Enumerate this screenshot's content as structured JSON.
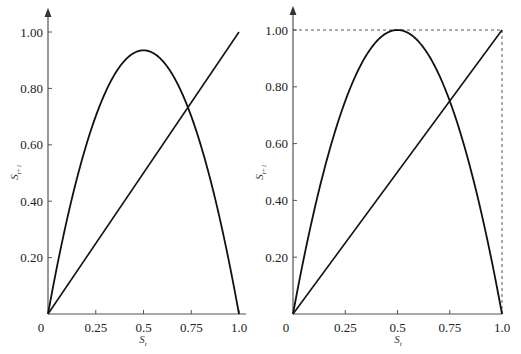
{
  "chart_data": [
    {
      "type": "line",
      "title": "",
      "xlabel": "S_t",
      "ylabel": "S_{t+1}",
      "xlim": [
        0,
        1.0
      ],
      "ylim": [
        0,
        1.0
      ],
      "x_ticks": [
        "0",
        "0.25",
        "0.5",
        "0.75",
        "1.0"
      ],
      "x_tick_values": [
        0,
        0.25,
        0.5,
        0.75,
        1.0
      ],
      "y_ticks": [
        "0.20",
        "0.40",
        "0.60",
        "0.80",
        "1.00"
      ],
      "y_tick_values": [
        0.2,
        0.4,
        0.6,
        0.8,
        1.0
      ],
      "grid": false,
      "series": [
        {
          "name": "logistic map",
          "kind": "parabola",
          "growth_rate": 3.74,
          "peak": {
            "x": 0.5,
            "y": 0.935
          },
          "x": [
            0,
            0.1,
            0.2,
            0.3,
            0.4,
            0.5,
            0.6,
            0.7,
            0.8,
            0.9,
            1.0
          ],
          "y": [
            0,
            0.337,
            0.598,
            0.785,
            0.898,
            0.935,
            0.898,
            0.785,
            0.598,
            0.337,
            0
          ]
        },
        {
          "name": "45-degree line",
          "kind": "identity",
          "x": [
            0,
            1.0
          ],
          "y": [
            0,
            1.0
          ]
        }
      ],
      "annotations": [
        {
          "text": "intersection",
          "x": 0.733,
          "y": 0.733
        }
      ],
      "bounding_box_dashed": false
    },
    {
      "type": "line",
      "title": "",
      "xlabel": "S_t",
      "ylabel": "S_{t+1}",
      "xlim": [
        0,
        1.0
      ],
      "ylim": [
        0,
        1.0
      ],
      "x_ticks": [
        "0",
        "0.25",
        "0.5",
        "0.75",
        "1.0"
      ],
      "x_tick_values": [
        0,
        0.25,
        0.5,
        0.75,
        1.0
      ],
      "y_ticks": [
        "0.20",
        "0.40",
        "0.60",
        "0.80",
        "1.00"
      ],
      "y_tick_values": [
        0.2,
        0.4,
        0.6,
        0.8,
        1.0
      ],
      "grid": false,
      "series": [
        {
          "name": "logistic map",
          "kind": "parabola",
          "growth_rate": 4.0,
          "peak": {
            "x": 0.5,
            "y": 1.0
          },
          "x": [
            0,
            0.1,
            0.2,
            0.3,
            0.4,
            0.5,
            0.6,
            0.7,
            0.8,
            0.9,
            1.0
          ],
          "y": [
            0,
            0.36,
            0.64,
            0.84,
            0.96,
            1.0,
            0.96,
            0.84,
            0.64,
            0.36,
            0
          ]
        },
        {
          "name": "45-degree line",
          "kind": "identity",
          "x": [
            0,
            1.0
          ],
          "y": [
            0,
            1.0
          ]
        }
      ],
      "annotations": [
        {
          "text": "intersection",
          "x": 0.75,
          "y": 0.75
        }
      ],
      "bounding_box_dashed": true
    }
  ]
}
